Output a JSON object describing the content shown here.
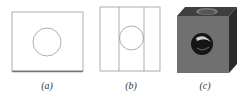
{
  "figure": {
    "panels": [
      {
        "id": "a",
        "caption": "(a)",
        "description": "front view: rectangle with circle"
      },
      {
        "id": "b",
        "caption": "(b)",
        "description": "side view: rectangle with two vertical lines and circle"
      },
      {
        "id": "c",
        "caption": "(c)",
        "description": "3D cube with through holes"
      }
    ],
    "colors": {
      "line": "#8a8a8a",
      "cube_front": "#6e6e6e",
      "cube_top": "#3f3f3f",
      "cube_side": "#2e2e2e",
      "hole": "#111111"
    }
  }
}
